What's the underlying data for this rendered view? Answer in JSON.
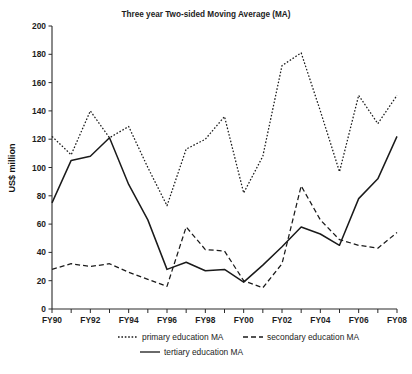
{
  "chart_data": {
    "type": "line",
    "title": "Three year Two-sided Moving Average (MA)",
    "xlabel": "",
    "ylabel": "US$ million",
    "ylim": [
      0,
      200
    ],
    "ytick_step": 20,
    "yticks": [
      "0",
      "20",
      "40",
      "60",
      "80",
      "100",
      "120",
      "140",
      "160",
      "180",
      "200"
    ],
    "grid": false,
    "legend_position": "bottom",
    "x": [
      "FY90",
      "FY91",
      "FY92",
      "FY93",
      "FY94",
      "FY95",
      "FY96",
      "FY97",
      "FY98",
      "FY99",
      "FY00",
      "FY01",
      "FY02",
      "FY03",
      "FY04",
      "FY05",
      "FY06",
      "FY07",
      "FY08"
    ],
    "xtick_labels": [
      "FY90",
      "",
      "FY92",
      "",
      "FY94",
      "",
      "FY96",
      "",
      "FY98",
      "",
      "FY00",
      "",
      "FY02",
      "",
      "FY04",
      "",
      "FY06",
      "",
      "FY08"
    ],
    "series": [
      {
        "name": "primary education MA",
        "style": "dotted",
        "values": [
          122,
          109,
          140,
          121,
          129,
          100,
          73,
          113,
          120,
          136,
          82,
          108,
          172,
          181,
          140,
          97,
          151,
          131,
          151
        ]
      },
      {
        "name": "secondary education MA",
        "style": "dashed",
        "values": [
          28,
          32,
          30,
          32,
          26,
          21,
          16,
          58,
          42,
          41,
          20,
          15,
          32,
          87,
          63,
          49,
          45,
          43,
          54
        ]
      },
      {
        "name": "tertiary education MA",
        "style": "solid",
        "values": [
          75,
          105,
          108,
          121,
          88,
          63,
          28,
          33,
          27,
          28,
          19,
          31,
          44,
          58,
          53,
          45,
          78,
          92,
          122
        ]
      }
    ]
  },
  "legend": {
    "items": [
      {
        "label": "primary education MA",
        "style": "dotted"
      },
      {
        "label": "secondary education MA",
        "style": "dashed"
      },
      {
        "label": "tertiary education MA",
        "style": "solid"
      }
    ]
  }
}
